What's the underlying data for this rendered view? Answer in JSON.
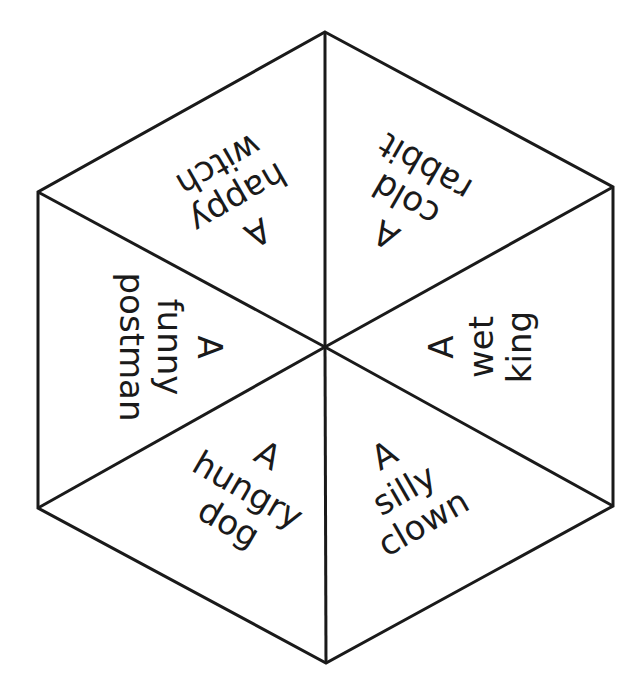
{
  "diagram": {
    "type": "hexagon-spinner",
    "background_color": "#ffffff",
    "line_color": "#1a1a1a",
    "text_color": "#1a1a1a",
    "vertices": {
      "top": [
        325,
        32
      ],
      "upper_right": [
        613,
        187
      ],
      "lower_right": [
        613,
        506
      ],
      "bottom": [
        326,
        663
      ],
      "lower_left": [
        38,
        508
      ],
      "upper_left": [
        38,
        192
      ],
      "center": [
        325,
        347
      ]
    },
    "segments": [
      {
        "id": "upper-left",
        "lines": [
          "A",
          "happy",
          "witch"
        ],
        "rotation": 150
      },
      {
        "id": "upper-right",
        "lines": [
          "A",
          "cold",
          "rabbit"
        ],
        "rotation": -150
      },
      {
        "id": "right",
        "lines": [
          "A",
          "wet",
          "king"
        ],
        "rotation": -90
      },
      {
        "id": "lower-right",
        "lines": [
          "A",
          "silly",
          "clown"
        ],
        "rotation": -30
      },
      {
        "id": "lower-left",
        "lines": [
          "A",
          "hungry",
          "dog"
        ],
        "rotation": 30
      },
      {
        "id": "left",
        "lines": [
          "A",
          "funny",
          "postman"
        ],
        "rotation": 90
      }
    ]
  }
}
